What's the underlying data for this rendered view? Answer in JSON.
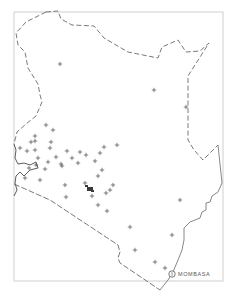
{
  "map": {
    "country": "Kenya",
    "frame": {
      "x": 14,
      "y": 12,
      "width": 209,
      "height": 269,
      "stroke": "#bdbdbd"
    },
    "colors": {
      "border": "#6a6a6a",
      "frame": "#bdbdbd",
      "marker": "#4a4a4a",
      "background": "#ffffff"
    },
    "cities": [
      {
        "name": "MOMBASA",
        "x": 172,
        "y": 274,
        "label_x": 178,
        "label_y": 271
      }
    ],
    "markers": [
      [
        60,
        64
      ],
      [
        154,
        90
      ],
      [
        186,
        107
      ],
      [
        46,
        125
      ],
      [
        53,
        130
      ],
      [
        35,
        136
      ],
      [
        31,
        142
      ],
      [
        35,
        141
      ],
      [
        51,
        142
      ],
      [
        20,
        148
      ],
      [
        27,
        151
      ],
      [
        35,
        150
      ],
      [
        50,
        148
      ],
      [
        38,
        158
      ],
      [
        117,
        145
      ],
      [
        67,
        151
      ],
      [
        80,
        152
      ],
      [
        72,
        158
      ],
      [
        86,
        155
      ],
      [
        100,
        153
      ],
      [
        104,
        147
      ],
      [
        56,
        157
      ],
      [
        61,
        164
      ],
      [
        78,
        163
      ],
      [
        95,
        161
      ],
      [
        102,
        170
      ],
      [
        29,
        168
      ],
      [
        36,
        165
      ],
      [
        45,
        169
      ],
      [
        48,
        162
      ],
      [
        62,
        166
      ],
      [
        25,
        178
      ],
      [
        40,
        180
      ],
      [
        65,
        185
      ],
      [
        85,
        183
      ],
      [
        98,
        176
      ],
      [
        66,
        197
      ],
      [
        92,
        196
      ],
      [
        106,
        193
      ],
      [
        110,
        190
      ],
      [
        113,
        185
      ],
      [
        98,
        205
      ],
      [
        107,
        211
      ],
      [
        180,
        200
      ],
      [
        172,
        235
      ],
      [
        130,
        227
      ],
      [
        135,
        250
      ],
      [
        155,
        262
      ],
      [
        165,
        268
      ]
    ],
    "dense_cluster": {
      "x": 90,
      "y": 190,
      "label": "cluster"
    },
    "caption": ""
  }
}
